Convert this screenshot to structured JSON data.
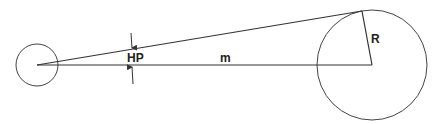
{
  "diagram": {
    "labels": {
      "parallax": "HP",
      "distance": "m",
      "radius": "R"
    },
    "colors": {
      "stroke": "#333333",
      "background": "#ffffff"
    },
    "elements": {
      "small_circle": {
        "cx": 37,
        "cy": 65,
        "r": 21
      },
      "large_circle": {
        "cx": 372,
        "cy": 65,
        "r": 55
      },
      "tangent_point": {
        "x": 362,
        "y": 11
      }
    }
  }
}
